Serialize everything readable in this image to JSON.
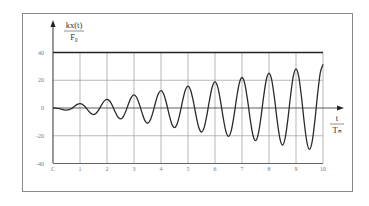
{
  "chart_data": {
    "type": "line",
    "title": "",
    "xlabel": {
      "numerator": "t",
      "denominator": "Tₙ"
    },
    "ylabel": {
      "numerator": "kx(t)",
      "denominator": "F₀"
    },
    "xlim": [
      0,
      10
    ],
    "ylim": [
      -40,
      40
    ],
    "x_ticks": [
      "C",
      "1",
      "2",
      "3",
      "4",
      "5",
      "6",
      "7",
      "8",
      "9",
      "10"
    ],
    "y_ticks": [
      "40",
      "20",
      "0",
      "-20",
      "-40"
    ],
    "grid": true,
    "legend": null,
    "series": [
      {
        "name": "response",
        "x_step": 0.1,
        "x_start": 0,
        "values": [
          0,
          -0.04,
          -0.28,
          -0.77,
          -1.31,
          -1.57,
          -1.23,
          -0.2,
          1.25,
          2.58,
          3.14,
          2.5,
          0.69,
          -1.74,
          -3.85,
          -4.71,
          -3.77,
          -1.17,
          2.22,
          5.12,
          6.28,
          5.04,
          1.66,
          -2.71,
          -6.39,
          -7.85,
          -6.31,
          -2.15,
          3.19,
          7.66,
          9.42,
          7.58,
          2.63,
          -3.68,
          -8.94,
          -11.0,
          -8.86,
          -3.12,
          4.16,
          10.21,
          12.57,
          10.13,
          3.6,
          -4.65,
          -11.48,
          -14.14,
          -11.4,
          -4.09,
          5.14,
          12.75,
          15.71,
          12.67,
          4.57,
          -5.62,
          -14.02,
          -17.28,
          -13.94,
          -5.06,
          6.11,
          15.29,
          18.85,
          15.21,
          5.54,
          -6.59,
          -16.56,
          -20.42,
          -16.48,
          -6.03,
          7.08,
          17.83,
          21.99,
          17.75,
          6.51,
          -7.56,
          -19.1,
          -23.56,
          -19.02,
          -7.0,
          8.05,
          20.37,
          25.13,
          20.29,
          7.48,
          -8.53,
          -21.64,
          -26.7,
          -21.56,
          -7.97,
          9.02,
          22.91,
          28.27,
          22.83,
          8.46,
          -9.5,
          -24.19,
          -29.85,
          -24.11,
          -8.94,
          9.99,
          25.46,
          31.42
        ]
      }
    ]
  },
  "colors": {
    "background": "#ffffff",
    "frame": "#8a8a8a",
    "grid": "#9a9a9a",
    "axis": "#333333",
    "curve": "#2a2a2a"
  }
}
